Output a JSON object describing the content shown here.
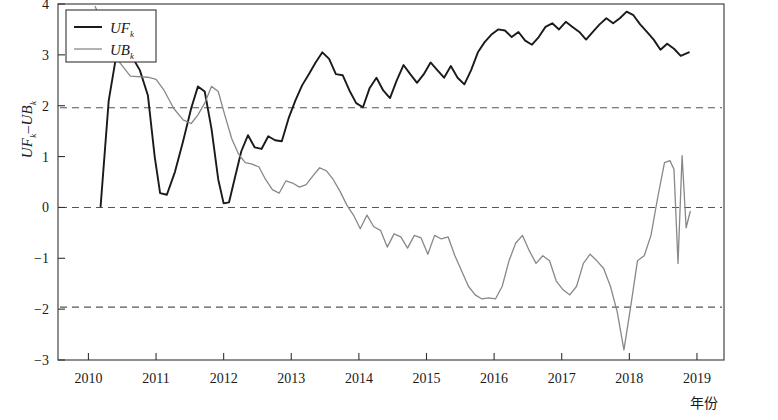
{
  "chart_data": {
    "type": "line",
    "title": "",
    "xlabel": "年份",
    "ylabel": "UF_k–UB_k",
    "ylabel_parts": {
      "a": "UF",
      "a_sub": "k",
      "dash": "–",
      "b": "UB",
      "b_sub": "k"
    },
    "xlim": [
      2009.55,
      2019.4
    ],
    "ylim": [
      -3,
      4
    ],
    "xticks": [
      2010,
      2011,
      2012,
      2013,
      2014,
      2015,
      2016,
      2017,
      2018,
      2019
    ],
    "xtick_labels": [
      "2010",
      "2011",
      "2012",
      "2013",
      "2014",
      "2015",
      "2016",
      "2017",
      "2018",
      "2019"
    ],
    "yticks": [
      -3,
      -2,
      -1,
      0,
      1,
      2,
      3,
      4
    ],
    "ytick_labels": [
      "−3",
      "−2",
      "−1",
      "0",
      "1",
      "2",
      "3",
      "4"
    ],
    "grid": false,
    "legend_position": "top-left",
    "reference_lines": [
      {
        "name": "upper-confidence-line",
        "value": 1.96,
        "style": "dashed",
        "color": "#555555"
      },
      {
        "name": "zero-line",
        "value": 0,
        "style": "dashed",
        "color": "#555555"
      },
      {
        "name": "lower-confidence-line",
        "value": -1.96,
        "style": "dashed",
        "color": "#555555"
      }
    ],
    "series": [
      {
        "name": "UF_k",
        "label": "UF",
        "label_sub": "k",
        "color": "#1a1a1a",
        "width": 1.9,
        "x": [
          2010.18,
          2010.3,
          2010.42,
          2010.52,
          2010.62,
          2010.76,
          2010.88,
          2010.98,
          2011.06,
          2011.16,
          2011.28,
          2011.4,
          2011.52,
          2011.62,
          2011.72,
          2011.82,
          2011.92,
          2012.0,
          2012.08,
          2012.16,
          2012.26,
          2012.36,
          2012.46,
          2012.56,
          2012.66,
          2012.76,
          2012.86,
          2012.96,
          2013.06,
          2013.16,
          2013.26,
          2013.36,
          2013.46,
          2013.56,
          2013.66,
          2013.76,
          2013.86,
          2013.96,
          2014.06,
          2014.16,
          2014.26,
          2014.36,
          2014.46,
          2014.56,
          2014.66,
          2014.76,
          2014.86,
          2014.96,
          2015.06,
          2015.16,
          2015.26,
          2015.36,
          2015.46,
          2015.56,
          2015.66,
          2015.76,
          2015.86,
          2015.96,
          2016.06,
          2016.16,
          2016.26,
          2016.36,
          2016.46,
          2016.56,
          2016.66,
          2016.76,
          2016.86,
          2016.96,
          2017.06,
          2017.16,
          2017.26,
          2017.36,
          2017.46,
          2017.56,
          2017.66,
          2017.76,
          2017.86,
          2017.96,
          2018.06,
          2018.16,
          2018.26,
          2018.36,
          2018.46,
          2018.56,
          2018.66,
          2018.76,
          2018.88
        ],
        "values": [
          0.02,
          2.1,
          3.05,
          2.98,
          3.02,
          2.7,
          2.2,
          1.0,
          0.28,
          0.25,
          0.7,
          1.3,
          1.95,
          2.38,
          2.28,
          1.55,
          0.55,
          0.08,
          0.1,
          0.55,
          1.1,
          1.42,
          1.18,
          1.15,
          1.4,
          1.32,
          1.3,
          1.75,
          2.1,
          2.4,
          2.62,
          2.85,
          3.05,
          2.92,
          2.62,
          2.6,
          2.3,
          2.05,
          1.97,
          2.35,
          2.55,
          2.3,
          2.15,
          2.5,
          2.8,
          2.62,
          2.45,
          2.62,
          2.85,
          2.7,
          2.55,
          2.78,
          2.55,
          2.42,
          2.7,
          3.05,
          3.25,
          3.4,
          3.5,
          3.48,
          3.35,
          3.45,
          3.28,
          3.2,
          3.35,
          3.55,
          3.62,
          3.5,
          3.65,
          3.55,
          3.45,
          3.3,
          3.45,
          3.6,
          3.72,
          3.62,
          3.72,
          3.85,
          3.78,
          3.6,
          3.45,
          3.3,
          3.1,
          3.22,
          3.12,
          2.98,
          3.05
        ]
      },
      {
        "name": "UB_k",
        "label": "UB",
        "label_sub": "k",
        "color": "#888888",
        "width": 1.3,
        "x": [
          2010.1,
          2010.42,
          2010.62,
          2010.88,
          2011.0,
          2011.12,
          2011.26,
          2011.4,
          2011.52,
          2011.62,
          2011.72,
          2011.82,
          2011.92,
          2012.02,
          2012.12,
          2012.22,
          2012.32,
          2012.42,
          2012.52,
          2012.62,
          2012.72,
          2012.82,
          2012.92,
          2013.02,
          2013.12,
          2013.22,
          2013.32,
          2013.42,
          2013.52,
          2013.62,
          2013.72,
          2013.82,
          2013.92,
          2014.02,
          2014.12,
          2014.22,
          2014.32,
          2014.42,
          2014.52,
          2014.62,
          2014.72,
          2014.82,
          2014.92,
          2015.02,
          2015.12,
          2015.22,
          2015.32,
          2015.42,
          2015.52,
          2015.62,
          2015.72,
          2015.82,
          2015.92,
          2016.02,
          2016.12,
          2016.22,
          2016.32,
          2016.42,
          2016.52,
          2016.62,
          2016.72,
          2016.82,
          2016.92,
          2017.02,
          2017.12,
          2017.22,
          2017.32,
          2017.42,
          2017.52,
          2017.62,
          2017.72,
          2017.82,
          2017.92,
          2018.02,
          2018.12,
          2018.22,
          2018.32,
          2018.42,
          2018.52,
          2018.6,
          2018.66,
          2018.72,
          2018.78,
          2018.84,
          2018.9
        ],
        "values": [
          3.95,
          2.92,
          2.58,
          2.56,
          2.52,
          2.3,
          1.95,
          1.72,
          1.65,
          1.82,
          2.05,
          2.38,
          2.28,
          1.8,
          1.35,
          1.05,
          0.88,
          0.85,
          0.8,
          0.55,
          0.35,
          0.28,
          0.52,
          0.48,
          0.4,
          0.45,
          0.62,
          0.78,
          0.72,
          0.55,
          0.32,
          0.05,
          -0.15,
          -0.42,
          -0.15,
          -0.38,
          -0.45,
          -0.78,
          -0.52,
          -0.58,
          -0.8,
          -0.55,
          -0.6,
          -0.92,
          -0.55,
          -0.62,
          -0.58,
          -0.95,
          -1.25,
          -1.55,
          -1.72,
          -1.8,
          -1.78,
          -1.8,
          -1.55,
          -1.05,
          -0.7,
          -0.55,
          -0.85,
          -1.1,
          -0.95,
          -1.05,
          -1.45,
          -1.62,
          -1.72,
          -1.55,
          -1.1,
          -0.92,
          -1.05,
          -1.2,
          -1.55,
          -2.05,
          -2.8,
          -1.95,
          -1.05,
          -0.95,
          -0.55,
          0.2,
          0.88,
          0.92,
          0.75,
          -1.1,
          1.02,
          -0.4,
          -0.08
        ]
      }
    ],
    "annotations": []
  },
  "legend": {
    "items": [
      {
        "name": "legend-item-uf",
        "label": "UF",
        "sub": "k",
        "color": "#1a1a1a"
      },
      {
        "name": "legend-item-ub",
        "label": "UB",
        "sub": "k",
        "color": "#888888"
      }
    ]
  }
}
